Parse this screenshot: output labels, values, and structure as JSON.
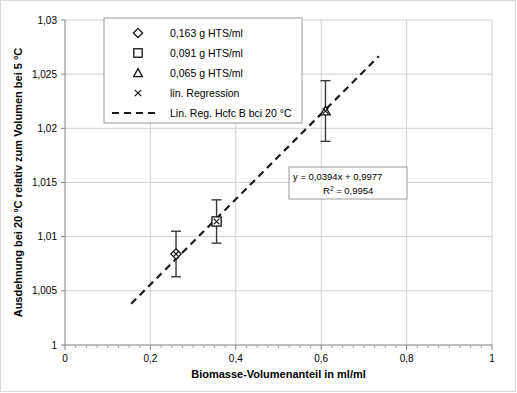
{
  "chart_data": {
    "type": "scatter",
    "title": "",
    "xlabel": "Biomasse-Volumenanteil in ml/ml",
    "ylabel": "Ausdehnung bei 20 °C relativ zum Volumen bei 5 °C",
    "xlim": [
      0,
      1
    ],
    "ylim": [
      1,
      1.03
    ],
    "xticks": [
      0,
      0.2,
      0.4,
      0.6,
      0.8,
      1
    ],
    "xtick_labels": [
      "0",
      "0,2",
      "0,4",
      "0,6",
      "0,8",
      "1"
    ],
    "yticks": [
      1,
      1.005,
      1.01,
      1.015,
      1.02,
      1.025,
      1.03
    ],
    "ytick_labels": [
      "1",
      "1,005",
      "1,01",
      "1,015",
      "1,02",
      "1,025",
      "1,03"
    ],
    "grid": true,
    "grid_axes": "both",
    "minor_ticks_x": true,
    "legend_position": "top-left-inside",
    "series": [
      {
        "name": "0,163 g HTS/ml",
        "marker": "diamond",
        "points": [
          {
            "x": 0.26,
            "y": 1.0084,
            "yerr": 0.0021
          }
        ]
      },
      {
        "name": "0,091 g HTS/ml",
        "marker": "square",
        "points": [
          {
            "x": 0.355,
            "y": 1.0114,
            "yerr": 0.002
          }
        ]
      },
      {
        "name": "0,065 g HTS/ml",
        "marker": "triangle",
        "points": [
          {
            "x": 0.61,
            "y": 1.0216,
            "yerr": 0.0028
          }
        ]
      },
      {
        "name": "lin. Regression",
        "marker": "x",
        "points": [
          {
            "x": 0.26,
            "y": 1.0084
          },
          {
            "x": 0.355,
            "y": 1.0114
          },
          {
            "x": 0.61,
            "y": 1.0216
          }
        ]
      }
    ],
    "fit_line": {
      "name": "Lin. Reg. Hcfc B bci 20 °C",
      "style": "dashed",
      "slope": 0.0394,
      "intercept": 0.9977,
      "r2": 0.9954,
      "x_start": 0.155,
      "x_end": 0.735,
      "equation_label": "y = 0,0394x + 0,9977",
      "r2_label": "R",
      "r2_sup": "2",
      "r2_value": " = 0,9954"
    }
  },
  "legend": {
    "items": [
      {
        "label": "0,163 g HTS/ml",
        "marker": "diamond"
      },
      {
        "label": "0,091 g HTS/ml",
        "marker": "square"
      },
      {
        "label": "0,065 g HTS/ml",
        "marker": "triangle"
      },
      {
        "label": "lin. Regression",
        "marker": "x"
      },
      {
        "label": "Lin. Reg. Hcfc B bci 20 °C",
        "marker": "dashed-line"
      }
    ]
  }
}
